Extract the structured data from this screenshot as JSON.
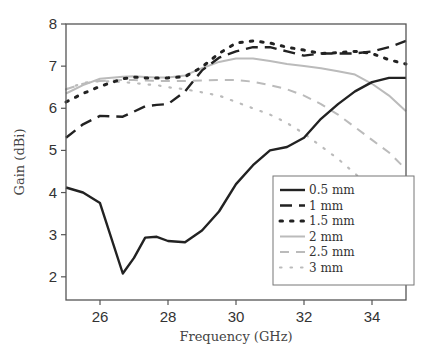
{
  "chart_data": {
    "type": "line",
    "title": "",
    "xlabel": "Frequency (GHz)",
    "ylabel": "Gain (dBi)",
    "xlim": [
      25,
      35
    ],
    "ylim": [
      1.45,
      8
    ],
    "xticks": [
      26,
      28,
      30,
      32,
      34
    ],
    "yticks": [
      2,
      3,
      4,
      5,
      6,
      7,
      8
    ],
    "grid": false,
    "legend_position": "lower right (inside)",
    "x": [
      25,
      25.5,
      26,
      26.67,
      27,
      27.33,
      27.67,
      28,
      28.5,
      29,
      29.5,
      30,
      30.5,
      31,
      31.5,
      32,
      32.5,
      33,
      33.5,
      34,
      34.5,
      35
    ],
    "series": [
      {
        "name": "0.5 mm",
        "style": "solid",
        "color": "#222222",
        "values": [
          4.12,
          4.0,
          3.75,
          2.08,
          2.45,
          2.93,
          2.95,
          2.85,
          2.82,
          3.1,
          3.55,
          4.2,
          4.65,
          5.0,
          5.08,
          5.3,
          5.75,
          6.1,
          6.4,
          6.62,
          6.72,
          6.72
        ]
      },
      {
        "name": "1 mm",
        "style": "dashed",
        "color": "#222222",
        "values": [
          5.3,
          5.62,
          5.82,
          5.8,
          5.92,
          6.05,
          6.08,
          6.1,
          6.4,
          6.9,
          7.2,
          7.35,
          7.45,
          7.45,
          7.35,
          7.25,
          7.3,
          7.3,
          7.3,
          7.35,
          7.45,
          7.6
        ]
      },
      {
        "name": "1.5 mm",
        "style": "dotted",
        "color": "#222222",
        "values": [
          6.15,
          6.35,
          6.52,
          6.7,
          6.74,
          6.72,
          6.72,
          6.72,
          6.75,
          6.98,
          7.3,
          7.55,
          7.6,
          7.55,
          7.45,
          7.38,
          7.3,
          7.32,
          7.35,
          7.3,
          7.15,
          7.05
        ]
      },
      {
        "name": "2 mm",
        "style": "solid",
        "color": "#bbbbbb",
        "values": [
          6.35,
          6.55,
          6.7,
          6.75,
          6.76,
          6.74,
          6.73,
          6.73,
          6.78,
          6.95,
          7.1,
          7.18,
          7.18,
          7.12,
          7.05,
          7.0,
          6.95,
          6.88,
          6.8,
          6.58,
          6.3,
          5.93
        ]
      },
      {
        "name": "2.5 mm",
        "style": "dashed",
        "color": "#bbbbbb",
        "values": [
          6.45,
          6.58,
          6.65,
          6.67,
          6.67,
          6.66,
          6.65,
          6.65,
          6.65,
          6.66,
          6.67,
          6.67,
          6.63,
          6.55,
          6.45,
          6.3,
          6.1,
          5.85,
          5.55,
          5.25,
          4.95,
          4.55
        ]
      },
      {
        "name": "3 mm",
        "style": "dotted",
        "color": "#bbbbbb",
        "values": [
          6.45,
          6.6,
          6.65,
          6.62,
          6.6,
          6.57,
          6.55,
          6.5,
          6.45,
          6.38,
          6.3,
          6.15,
          6.0,
          5.85,
          5.65,
          5.4,
          5.1,
          4.8,
          4.45,
          4.1,
          3.7,
          3.25
        ]
      }
    ]
  },
  "axes": {
    "xlabel": "Frequency (GHz)",
    "ylabel": "Gain (dBi)",
    "xtick_labels": [
      "26",
      "28",
      "30",
      "32",
      "34"
    ],
    "ytick_labels": [
      "2",
      "3",
      "4",
      "5",
      "6",
      "7",
      "8"
    ]
  },
  "legend": {
    "items": [
      "0.5 mm",
      "1 mm",
      "1.5 mm",
      "2 mm",
      "2.5 mm",
      "3 mm"
    ]
  }
}
